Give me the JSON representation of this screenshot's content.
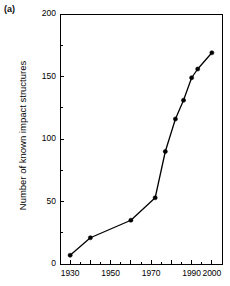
{
  "panel": {
    "label": "(a)"
  },
  "chart_data": {
    "type": "line",
    "title": "",
    "xlabel": "",
    "ylabel": "Number of known impact structures",
    "xlim": [
      1925,
      2005
    ],
    "ylim": [
      0,
      200
    ],
    "grid": false,
    "legend": "none",
    "x_ticks_major": [
      1930,
      1950,
      1970,
      1990,
      2000
    ],
    "x_tick_labels": [
      "1930",
      "1950",
      "1970",
      "1990",
      "2000"
    ],
    "x_ticks_all": [
      1930,
      1940,
      1950,
      1960,
      1970,
      1980,
      1990,
      2000
    ],
    "y_ticks": [
      0,
      50,
      100,
      150,
      200
    ],
    "y_tick_labels": [
      "0",
      "50",
      "100",
      "150",
      "200"
    ],
    "x": [
      1930,
      1940,
      1960,
      1972,
      1977,
      1982,
      1986,
      1990,
      1993,
      2000
    ],
    "values": [
      7,
      21,
      35,
      53,
      90,
      116,
      131,
      149,
      156,
      169
    ],
    "marker": "filled-circle",
    "line_color": "#000000",
    "marker_color": "#000000"
  }
}
